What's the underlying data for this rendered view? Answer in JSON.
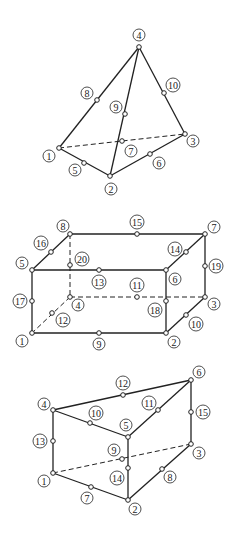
{
  "figures": [
    {
      "name": "tetrahedron",
      "labels": {
        "n1": "1",
        "n2": "2",
        "n3": "3",
        "n4": "4",
        "n5": "5",
        "n6": "6",
        "n7": "7",
        "n8": "8",
        "n9": "9",
        "n10": "10"
      }
    },
    {
      "name": "hexahedron",
      "labels": {
        "n1": "1",
        "n2": "2",
        "n3": "3",
        "n4": "4",
        "n5": "5",
        "n6": "6",
        "n7": "7",
        "n8": "8",
        "n9": "9",
        "n10": "10",
        "n11": "11",
        "n12": "12",
        "n13": "13",
        "n14": "14",
        "n15": "15",
        "n16": "16",
        "n17": "17",
        "n18": "18",
        "n19": "19",
        "n20": "20"
      }
    },
    {
      "name": "wedge",
      "labels": {
        "n1": "1",
        "n2": "2",
        "n3": "3",
        "n4": "4",
        "n5": "5",
        "n6": "6",
        "n7": "7",
        "n8": "8",
        "n9": "9",
        "n10": "10",
        "n11": "11",
        "n12": "12",
        "n13": "13",
        "n14": "14",
        "n15": "15"
      }
    }
  ]
}
